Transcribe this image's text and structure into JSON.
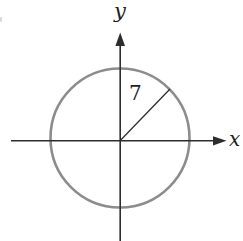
{
  "axis_labels": {
    "x": "x",
    "y": "y"
  },
  "radius_label": "7",
  "colors": {
    "background": "#ffffff",
    "circle_stroke": "#8c8c8c",
    "axis_stroke": "#2d2d2d",
    "label_text": "#1f1f1f"
  }
}
